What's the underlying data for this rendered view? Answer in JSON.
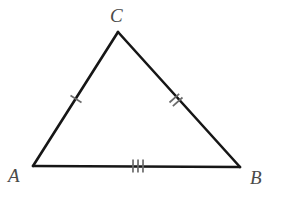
{
  "figure": {
    "kind": "geometry-diagram",
    "shape": "triangle",
    "background_color": "#ffffff",
    "stroke_color": "#161616",
    "tick_color": "#6a6a6a",
    "label_color": "#4a4a4a",
    "stroke_width": 2.6,
    "canvas": {
      "width": 294,
      "height": 209
    }
  },
  "vertices": [
    {
      "name": "C",
      "label": "C",
      "x": 118,
      "y": 32,
      "label_x": 110,
      "label_y": 6
    },
    {
      "name": "A",
      "label": "A",
      "x": 33,
      "y": 166,
      "label_x": 8,
      "label_y": 166
    },
    {
      "name": "B",
      "label": "B",
      "x": 240,
      "y": 167,
      "label_x": 250,
      "label_y": 168
    }
  ],
  "sides": [
    {
      "name": "side-AC",
      "from": "A",
      "to": "C",
      "tick_count": 1,
      "tick_center": {
        "x": 76,
        "y": 99
      },
      "tick_length": 13,
      "tick_spacing": 5
    },
    {
      "name": "side-CB",
      "from": "C",
      "to": "B",
      "tick_count": 2,
      "tick_center": {
        "x": 176,
        "y": 100
      },
      "tick_length": 13,
      "tick_spacing": 5
    },
    {
      "name": "side-AB",
      "from": "A",
      "to": "B",
      "tick_count": 3,
      "tick_center": {
        "x": 138,
        "y": 166
      },
      "tick_length": 13,
      "tick_spacing": 5
    }
  ]
}
